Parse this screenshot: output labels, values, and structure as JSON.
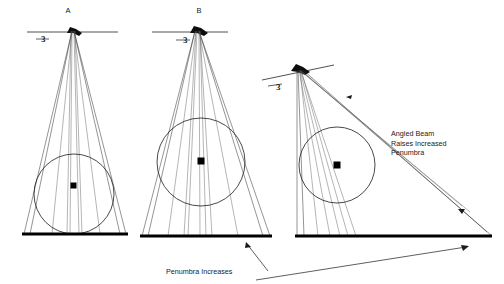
{
  "figure": {
    "title_present": false,
    "background_color": "#ffffff",
    "ink_color": "#1a1a1a",
    "width": 504,
    "height": 284
  },
  "panels": [
    {
      "id": "panel-a",
      "label": "A",
      "label_x": 68,
      "label_y": 12,
      "source_marker": "3",
      "marker_x": 47,
      "marker_y": 40,
      "apex": {
        "x": 72,
        "y": 32
      },
      "source_bar": {
        "x1": 27,
        "y1": 32,
        "x2": 118,
        "y2": 32
      },
      "ground": {
        "x1": 22,
        "y1": 234,
        "x2": 128,
        "y2": 234
      },
      "circle": {
        "cx": 74,
        "cy": 194,
        "r": 40
      },
      "center_dot": {
        "x": 74,
        "y": 186
      },
      "description": "Small focal spot, normal beam, tight penumbra"
    },
    {
      "id": "panel-b",
      "label": "B",
      "label_x": 199,
      "label_y": 12,
      "source_marker": "3",
      "marker_x": 188,
      "marker_y": 40,
      "apex": {
        "x": 197,
        "y": 32
      },
      "source_bar": {
        "x1": 154,
        "y1": 32,
        "x2": 226,
        "y2": 32
      },
      "ground": {
        "x1": 140,
        "y1": 236,
        "x2": 272,
        "y2": 236
      },
      "circle": {
        "cx": 201,
        "cy": 162,
        "r": 44
      },
      "center_dot": {
        "x": 201,
        "y": 161
      },
      "description": "Object raised off cassette, penumbra increases"
    },
    {
      "id": "panel-c",
      "label": "",
      "source_marker": "3",
      "marker_x": 279,
      "marker_y": 85,
      "apex": {
        "x": 298,
        "y": 70
      },
      "source_bar": {
        "x1": 262,
        "y1": 80,
        "x2": 333,
        "y2": 66
      },
      "ground": {
        "x1": 295,
        "y1": 236,
        "x2": 492,
        "y2": 236
      },
      "circle": {
        "cx": 337,
        "cy": 165,
        "r": 38
      },
      "center_dot": {
        "x": 337,
        "y": 165
      },
      "description": "Angled beam with raised object, largest penumbra"
    }
  ],
  "annotations": [
    {
      "id": "angled-beam-note",
      "lines": [
        "Angled Beam",
        "Raises Increased",
        "Penumbra"
      ],
      "x": 391,
      "y": 133,
      "line_height": 9.5
    },
    {
      "id": "penumbra-increases-note",
      "lines": [
        "Penumbra Increases"
      ],
      "x": 166,
      "y": 272,
      "line_height": 9.5
    }
  ],
  "annotation_arrows": [
    {
      "id": "arrow-to-panel-b-ground",
      "x1": 268,
      "y1": 272,
      "x2": 245,
      "y2": 243
    },
    {
      "id": "arrow-to-panel-c-ground",
      "x1": 258,
      "y1": 279,
      "x2": 466,
      "y2": 246
    }
  ]
}
